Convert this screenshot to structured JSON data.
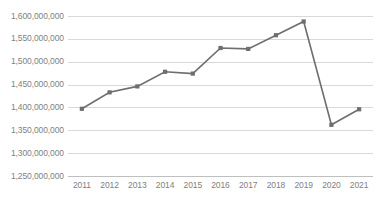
{
  "chart_data": {
    "type": "line",
    "title": "",
    "subtitle": "",
    "xlabel": "",
    "ylabel": "",
    "categories": [
      "2011",
      "2012",
      "2013",
      "2014",
      "2015",
      "2016",
      "2017",
      "2018",
      "2019",
      "2020",
      "2021"
    ],
    "series": [
      {
        "name": "",
        "values": [
          1397000000,
          1433000000,
          1446000000,
          1478000000,
          1474000000,
          1530000000,
          1528000000,
          1558000000,
          1588000000,
          1362000000,
          1396000000
        ]
      }
    ],
    "ylim": [
      1250000000,
      1600000000
    ],
    "ytick_values": [
      1600000000,
      1550000000,
      1500000000,
      1450000000,
      1400000000,
      1350000000,
      1300000000,
      1250000000
    ],
    "ytick_labels": [
      "1,600,000,000",
      "1,550,000,000",
      "1,500,000,000",
      "1,450,000,000",
      "1,400,000,000",
      "1,350,000,000",
      "1,300,000,000",
      "1,250,000,000"
    ],
    "xtick_labels": [
      "2011",
      "2012",
      "2013",
      "2014",
      "2015",
      "2016",
      "2017",
      "2018",
      "2019",
      "2020",
      "2021"
    ],
    "grid": true,
    "grid_axis": "y",
    "legend": false,
    "legend_position": "none",
    "marker": "square",
    "line_color": "#6e6e6e",
    "marker_color": "#6e6e6e",
    "grid_color": "#d9d9d9",
    "axis_color": "#bfbfbf",
    "tick_label_color": "#7f7f7f",
    "background_color": "#ffffff",
    "annotations": []
  }
}
